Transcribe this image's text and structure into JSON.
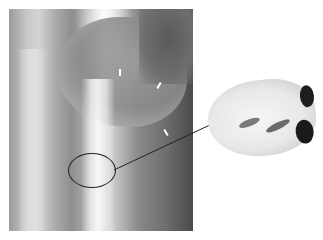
{
  "figure": {
    "type": "radiograph-with-specimen",
    "left_panel": "x-ray",
    "right_panel": "gross-specimen",
    "annotation": {
      "shape": "ellipse",
      "connector": "leader-line"
    },
    "colors": {
      "background": "#ffffff",
      "annotation_stroke": "#222222"
    }
  }
}
